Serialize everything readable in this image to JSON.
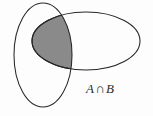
{
  "figure": {
    "kind": "venn-diagram",
    "width": 153,
    "height": 116,
    "background_color": "#fdfdfd",
    "outline_color": "#262626",
    "shade_color": "#8a8a8a"
  },
  "sets": {
    "a": {
      "name": "A",
      "orientation": "vertical",
      "cx": 43,
      "cy": 55,
      "rx": 29,
      "ry": 52
    },
    "b": {
      "name": "B",
      "orientation": "horizontal",
      "cx": 86,
      "cy": 41,
      "rx": 54,
      "ry": 29
    }
  },
  "intersection": {
    "shaded": true,
    "fill_color": "#8a8a8a",
    "crossing_top": [
      64,
      17
    ],
    "crossing_bottom": [
      68,
      66
    ]
  },
  "label": {
    "set_a": "A",
    "operator": "∩",
    "set_b": "B",
    "full_text": "A ∩ B",
    "x": 86,
    "y": 82
  }
}
